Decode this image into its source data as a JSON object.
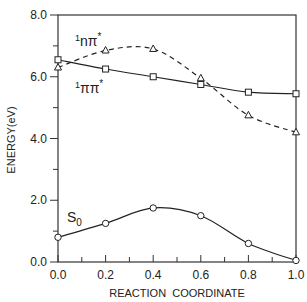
{
  "chart_data": {
    "type": "line",
    "title": "",
    "xlabel": "REACTION  COORDINATE",
    "ylabel": "ENERGY(eV)",
    "xlim": [
      0.0,
      1.0
    ],
    "ylim": [
      0.0,
      8.0
    ],
    "x_ticks": [
      "0.0",
      "0.2",
      "0.4",
      "0.6",
      "0.8",
      "1.0"
    ],
    "y_ticks": [
      "0.0",
      "2.0",
      "4.0",
      "6.0",
      "8.0"
    ],
    "x": [
      0.0,
      0.2,
      0.4,
      0.6,
      0.8,
      1.0
    ],
    "series": [
      {
        "name": "1nπ*",
        "label_sup": "1",
        "label_main": "nπ",
        "label_star": "*",
        "marker": "triangle",
        "line": "dashed",
        "values": [
          6.3,
          6.85,
          6.9,
          5.95,
          4.75,
          4.2
        ]
      },
      {
        "name": "1ππ*",
        "label_sup": "1",
        "label_main": "ππ",
        "label_star": "*",
        "marker": "square",
        "line": "solid",
        "values": [
          6.55,
          6.25,
          6.0,
          5.75,
          5.5,
          5.45
        ]
      },
      {
        "name": "S0",
        "label_main": "S",
        "label_sub": "0",
        "marker": "circle",
        "line": "solid",
        "values": [
          0.8,
          1.25,
          1.75,
          1.5,
          0.6,
          0.05
        ]
      }
    ],
    "grid": false,
    "legend": "inline labels"
  }
}
